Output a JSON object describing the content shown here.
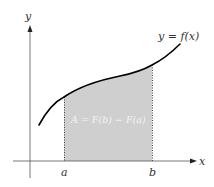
{
  "diagram": {
    "axis_labels": {
      "x": "x",
      "y": "y"
    },
    "curve_label": "y = f(x)",
    "interval": {
      "a": "a",
      "b": "b"
    },
    "area_label": "A = F(b) − F(a)",
    "colors": {
      "shade": "#cfcfcf",
      "curve": "#000000",
      "axis": "#333333",
      "bounds": "#444444"
    }
  }
}
